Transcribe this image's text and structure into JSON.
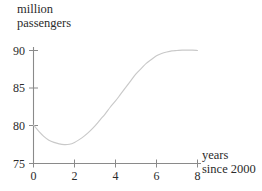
{
  "chart_data": {
    "type": "line",
    "title": "",
    "ylabel_line1": "million",
    "ylabel_line2": "passengers",
    "xlabel_line1": "years",
    "xlabel_line2": "since 2000",
    "xlim": [
      0,
      8
    ],
    "ylim": [
      75,
      90
    ],
    "xticks": [
      0,
      2,
      4,
      6,
      8
    ],
    "xtick_labels": [
      "0",
      "2",
      "4",
      "6",
      "8"
    ],
    "yticks": [
      75,
      80,
      85,
      90
    ],
    "ytick_labels": [
      "75",
      "80",
      "85",
      "90"
    ],
    "grid": false,
    "legend": "none",
    "series": [
      {
        "name": "million passengers",
        "color": "#c9c9c9",
        "x": [
          0.0,
          0.25,
          0.5,
          0.75,
          1.0,
          1.25,
          1.5,
          1.75,
          2.0,
          2.25,
          2.5,
          2.75,
          3.0,
          3.25,
          3.5,
          3.75,
          4.0,
          4.25,
          4.5,
          4.75,
          5.0,
          5.25,
          5.5,
          5.75,
          6.0,
          6.25,
          6.5,
          6.75,
          7.0,
          7.25,
          7.5,
          7.75,
          8.0
        ],
        "values": [
          80.1,
          79.3,
          78.6,
          78.1,
          77.8,
          77.6,
          77.5,
          77.55,
          77.8,
          78.2,
          78.7,
          79.3,
          80.0,
          80.8,
          81.6,
          82.5,
          83.3,
          84.2,
          85.1,
          86.0,
          86.9,
          87.6,
          88.3,
          88.8,
          89.3,
          89.6,
          89.8,
          89.95,
          90.0,
          90.05,
          90.05,
          90.05,
          90.0
        ]
      }
    ],
    "annotations": {
      "minimum_x": 1.5,
      "minimum_y": 77.5,
      "start_y": 80.1,
      "end_y": 90.0
    },
    "axis_color": "#8a8a8a",
    "curve_color": "#c9c9c9",
    "text_color": "#2b2b2b"
  }
}
